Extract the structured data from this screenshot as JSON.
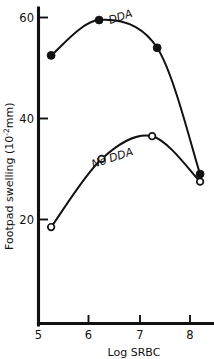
{
  "chart_data": {
    "type": "line",
    "title": "",
    "xlabel": "Log SRBC",
    "ylabel": "Footpad swelling (10⁻²mm)",
    "ylabel_main": "Footpad swelling (10",
    "ylabel_exponent": "-2",
    "ylabel_tail": "mm)",
    "xlim": [
      5,
      8.45
    ],
    "ylim": [
      12,
      62
    ],
    "grid": false,
    "legend": "inline-annotations",
    "xticks": [
      5,
      6,
      7,
      8
    ],
    "xtick_labels": [
      "5",
      "6",
      "7",
      "8"
    ],
    "yticks": [
      20,
      40,
      60
    ],
    "ytick_labels": [
      "20",
      "40",
      "60"
    ],
    "series": [
      {
        "name": "DDA",
        "label": "DDA",
        "marker": "filled-circle",
        "color": "#111111",
        "x": [
          5.25,
          6.2,
          7.35,
          8.2
        ],
        "values": [
          52.5,
          59.5,
          54.0,
          29.0
        ]
      },
      {
        "name": "No DDA",
        "label": "No DDA",
        "marker": "open-circle",
        "color": "#111111",
        "x": [
          5.25,
          6.25,
          7.25,
          8.2
        ],
        "values": [
          18.5,
          32.0,
          36.5,
          27.5
        ]
      }
    ]
  },
  "annotations": {
    "dda_label": "DDA",
    "no_dda_label": "No DDA"
  }
}
